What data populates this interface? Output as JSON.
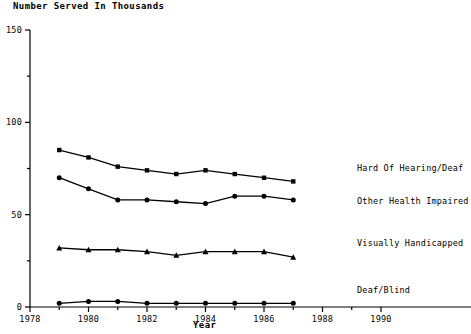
{
  "chart_data": {
    "type": "line",
    "title": "Number Served In Thousands",
    "xlabel": "Year",
    "ylabel": "",
    "x": [
      1979,
      1980,
      1981,
      1982,
      1983,
      1984,
      1985,
      1986,
      1987
    ],
    "xlim": [
      1978,
      1990
    ],
    "ylim": [
      0,
      150
    ],
    "grid": false,
    "legend_position": "right-inline",
    "xticks_major": [
      1978,
      1980,
      1982,
      1984,
      1986,
      1988,
      1990
    ],
    "xticks_minor": [
      1979,
      1981,
      1983,
      1985,
      1987,
      1989
    ],
    "xtick_labels": [
      "1978",
      "1980",
      "1982",
      "1984",
      "1986",
      "1988",
      "1990"
    ],
    "yticks_major": [
      0,
      50,
      100,
      150
    ],
    "yticks_minor": [
      25,
      75,
      125
    ],
    "ytick_labels": [
      "0",
      "50",
      "100",
      "150"
    ],
    "series": [
      {
        "name": "Hard Of Hearing/Deaf",
        "marker": "square",
        "values": [
          85,
          81,
          76,
          74,
          72,
          74,
          72,
          70,
          68
        ]
      },
      {
        "name": "Other Health Impaired",
        "marker": "circle",
        "values": [
          70,
          64,
          58,
          58,
          57,
          56,
          60,
          60,
          58
        ]
      },
      {
        "name": "Visually Handicapped",
        "marker": "triangle",
        "values": [
          32,
          31,
          31,
          30,
          28,
          30,
          30,
          30,
          27
        ]
      },
      {
        "name": "Deaf/Blind",
        "marker": "circle",
        "values": [
          2,
          3,
          3,
          2,
          2,
          2,
          2,
          2,
          2
        ]
      }
    ]
  },
  "colors": {
    "axis": "#000000",
    "series": "#000000",
    "background": "#ffffff"
  }
}
